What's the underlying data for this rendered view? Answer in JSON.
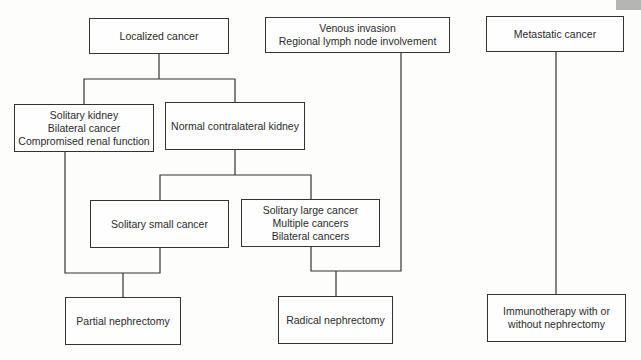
{
  "diagram": {
    "type": "flowchart",
    "nodes": [
      {
        "id": "localized",
        "lines": [
          "Localized cancer"
        ]
      },
      {
        "id": "venous",
        "lines": [
          "Venous invasion",
          "Regional lymph node involvement"
        ]
      },
      {
        "id": "metastatic",
        "lines": [
          "Metastatic cancer"
        ]
      },
      {
        "id": "solitary_kidney",
        "lines": [
          "Solitary kidney",
          "Bilateral cancer",
          "Compromised renal function"
        ]
      },
      {
        "id": "normal_contralateral",
        "lines": [
          "Normal contralateral kidney"
        ]
      },
      {
        "id": "solitary_small",
        "lines": [
          "Solitary small cancer"
        ]
      },
      {
        "id": "solitary_large",
        "lines": [
          "Solitary large cancer",
          "Multiple cancers",
          "Bilateral cancers"
        ]
      },
      {
        "id": "partial",
        "lines": [
          "Partial nephrectomy"
        ]
      },
      {
        "id": "radical",
        "lines": [
          "Radical nephrectomy"
        ]
      },
      {
        "id": "immunotherapy",
        "lines": [
          "Immunotherapy with or",
          "without nephrectomy"
        ]
      }
    ],
    "edges": [
      [
        "localized",
        "solitary_kidney"
      ],
      [
        "localized",
        "normal_contralateral"
      ],
      [
        "normal_contralateral",
        "solitary_small"
      ],
      [
        "normal_contralateral",
        "solitary_large"
      ],
      [
        "solitary_kidney",
        "partial"
      ],
      [
        "solitary_small",
        "partial"
      ],
      [
        "solitary_large",
        "radical"
      ],
      [
        "venous",
        "radical"
      ],
      [
        "metastatic",
        "immunotherapy"
      ]
    ],
    "colors": {
      "line": "#333333",
      "background": "#fdfdfb",
      "tab": "#b5b5b5"
    }
  }
}
